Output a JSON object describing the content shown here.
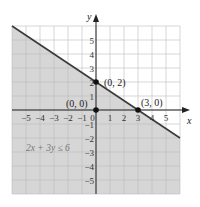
{
  "chart_data": {
    "type": "line",
    "title": "",
    "xlabel": "x",
    "ylabel": "y",
    "xlim": [
      -6,
      6
    ],
    "ylim": [
      -6,
      6
    ],
    "grid": true,
    "x_ticks": [
      -5,
      -4,
      -3,
      -2,
      -1,
      0,
      1,
      2,
      3,
      4,
      5
    ],
    "y_ticks": [
      -5,
      -4,
      -3,
      -2,
      -1,
      1,
      2,
      3,
      4,
      5
    ],
    "x_tick_labels": [
      "−5",
      "−4",
      "−3",
      "−2",
      "−1",
      "0",
      "1",
      "2",
      "3",
      "4",
      "5"
    ],
    "y_tick_labels": [
      "−5",
      "−4",
      "−3",
      "−2",
      "−1",
      "1",
      "2",
      "3",
      "4",
      "5"
    ],
    "series": [
      {
        "name": "2x + 3y = 6",
        "style": "solid boundary line",
        "x": [
          -6,
          6
        ],
        "y": [
          6,
          -2
        ]
      }
    ],
    "shaded_region": {
      "inequality": "2x + 3y ≤ 6",
      "side": "below line"
    },
    "points": [
      {
        "label": "(0, 2)",
        "x": 0,
        "y": 2
      },
      {
        "label": "(0, 0)",
        "x": 0,
        "y": 0
      },
      {
        "label": "(3, 0)",
        "x": 3,
        "y": 0
      }
    ],
    "annotations": [
      {
        "text": "2x + 3y ≤ 6",
        "x": -4.2,
        "y": -2.5
      }
    ]
  },
  "colors": {
    "shade": "#d6d6d6",
    "grid": "#bdbdbd",
    "grid_unshaded": "#d0d0d0",
    "line": "#3a3a3a",
    "axis": "#222222",
    "point": "#111111",
    "annotation": "#7a7a7a"
  },
  "labels": {
    "x_axis": "x",
    "y_axis": "y",
    "p02": "(0, 2)",
    "p00": "(0, 0)",
    "p30": "(3, 0)",
    "inequality": "2x + 3y ≤ 6"
  }
}
